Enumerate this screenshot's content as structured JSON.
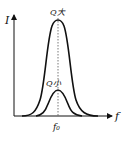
{
  "diagram": {
    "type": "resonance-curves",
    "axes": {
      "y_label": "I",
      "x_label": "f"
    },
    "center_label": "f₀",
    "curves": [
      {
        "name": "high-Q",
        "label": "Q大",
        "peak_height": "tall",
        "width": "narrow"
      },
      {
        "name": "low-Q",
        "label": "Q小",
        "peak_height": "low",
        "width": "wide"
      }
    ],
    "colors": {
      "line": "#111111",
      "background": "#ffffff"
    }
  }
}
